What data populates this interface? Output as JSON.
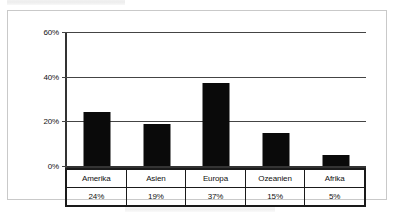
{
  "chart_data": {
    "type": "bar",
    "title": "",
    "xlabel": "",
    "ylabel": "",
    "categories": [
      "Amerika",
      "Asien",
      "Europa",
      "Ozeanien",
      "Afrika"
    ],
    "values": [
      24,
      19,
      37,
      15,
      5
    ],
    "value_labels": [
      "24%",
      "19%",
      "37%",
      "15%",
      "5%"
    ],
    "ylim": [
      0,
      60
    ],
    "yticks": [
      0,
      20,
      40,
      60
    ],
    "ytick_labels": [
      "0%",
      "20%",
      "40%",
      "60%"
    ],
    "grid": true,
    "legend": "none",
    "bar_color": "#0a0a0a",
    "axis_color": "#333333",
    "table_below": true
  },
  "axis": {
    "ticks": [
      {
        "label": "60%",
        "value": 60
      },
      {
        "label": "40%",
        "value": 40
      },
      {
        "label": "20%",
        "value": 20
      },
      {
        "label": "0%",
        "value": 0
      }
    ]
  },
  "table": {
    "category_row": [
      "Amerika",
      "Asien",
      "Europa",
      "Ozeanien",
      "Afrika"
    ],
    "value_row": [
      "24%",
      "19%",
      "37%",
      "15%",
      "5%"
    ]
  }
}
